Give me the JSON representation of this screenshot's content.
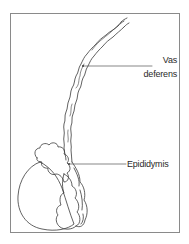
{
  "figure": {
    "type": "anatomical-line-drawing",
    "colors": {
      "stroke": "#3a3a3a",
      "frame": "#8a8a8a",
      "background": "#ffffff"
    }
  },
  "labels": {
    "vas_deferens_line1": "Vas",
    "vas_deferens_line2": "deferens",
    "epididymis": "Epididymis"
  },
  "structures": [
    {
      "name": "testis",
      "labeled": false
    },
    {
      "name": "epididymis",
      "labeled": true
    },
    {
      "name": "vas deferens",
      "labeled": true
    }
  ]
}
